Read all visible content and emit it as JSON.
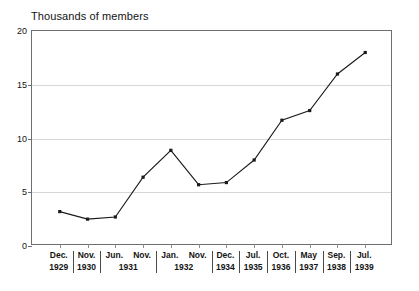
{
  "chart_data": {
    "type": "line",
    "title": "Thousands of members",
    "xlabel": "",
    "ylabel": "Thousands of members",
    "ylim": [
      0,
      20
    ],
    "yticks": [
      0,
      5,
      10,
      15,
      20
    ],
    "grid": true,
    "legend": "none",
    "categories": [
      "Dec. 1929",
      "Nov. 1930",
      "Jun. 1931",
      "Nov. 1931",
      "Jan. 1932",
      "Nov. 1932",
      "Dec. 1934",
      "Jul. 1935",
      "Oct. 1936",
      "May 1937",
      "Sep. 1938",
      "Jul. 1939"
    ],
    "values": [
      3.2,
      2.5,
      2.7,
      6.4,
      8.9,
      5.7,
      5.9,
      8.0,
      11.7,
      12.6,
      16.0,
      18.0
    ],
    "line_color": "#1a1a1a",
    "marker_color": "#1a1a1a",
    "grid_color": "#d7d7d7",
    "axis_color": "#6e6e6e"
  },
  "axis": {
    "y_tick_labels": [
      "20",
      "15",
      "10",
      "5",
      "0"
    ],
    "x_groups": [
      {
        "months": [
          "Dec."
        ],
        "year": "1929"
      },
      {
        "months": [
          "Nov."
        ],
        "year": "1930"
      },
      {
        "months": [
          "Jun.",
          "Nov."
        ],
        "year": "1931"
      },
      {
        "months": [
          "Jan.",
          "Nov."
        ],
        "year": "1932"
      },
      {
        "months": [
          "Dec."
        ],
        "year": "1934"
      },
      {
        "months": [
          "Jul."
        ],
        "year": "1935"
      },
      {
        "months": [
          "Oct."
        ],
        "year": "1936"
      },
      {
        "months": [
          "May"
        ],
        "year": "1937"
      },
      {
        "months": [
          "Sep."
        ],
        "year": "1938"
      },
      {
        "months": [
          "Jul."
        ],
        "year": "1939"
      }
    ]
  }
}
